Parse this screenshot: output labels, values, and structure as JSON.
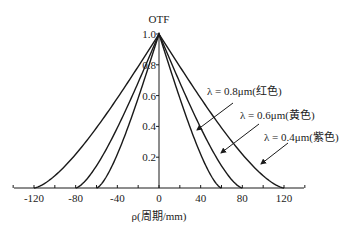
{
  "chart_data": {
    "type": "line",
    "title": "",
    "xlabel": "ρ(周期/mm)",
    "ylabel": "OTF",
    "xlim": [
      -140,
      140
    ],
    "ylim": [
      0,
      1.0
    ],
    "grid": false,
    "legend": "annotations with arrows",
    "x_ticks": [
      -120,
      -80,
      -40,
      0,
      40,
      80,
      120
    ],
    "x_tick_labels": [
      "-120",
      "-80",
      "-40",
      "0",
      "40",
      "80",
      "120"
    ],
    "y_ticks": [
      0.2,
      0.4,
      0.6,
      0.8,
      1.0
    ],
    "y_tick_labels": [
      "0.2",
      "0.4",
      "0.6",
      "0.8",
      "1.0"
    ],
    "x": [
      0,
      0.1,
      0.2,
      0.3,
      0.4,
      0.5,
      0.6,
      0.7,
      0.8,
      0.9,
      1.0
    ],
    "x_note": "normalized frequency ρ/ρc; curves are symmetric about ρ=0",
    "series": [
      {
        "name": "λ = 0.8μm(红色)",
        "cutoff": 60,
        "rho": [
          0,
          6,
          12,
          18,
          24,
          30,
          36,
          42,
          48,
          54,
          60
        ],
        "values": [
          1.0,
          0.873,
          0.747,
          0.624,
          0.505,
          0.391,
          0.285,
          0.188,
          0.104,
          0.037,
          0.0
        ]
      },
      {
        "name": "λ = 0.6μm(黄色)",
        "cutoff": 80,
        "rho": [
          0,
          8,
          16,
          24,
          32,
          40,
          48,
          56,
          64,
          72,
          80
        ],
        "values": [
          1.0,
          0.873,
          0.747,
          0.624,
          0.505,
          0.391,
          0.285,
          0.188,
          0.104,
          0.037,
          0.0
        ]
      },
      {
        "name": "λ = 0.4μm(紫色)",
        "cutoff": 120,
        "rho": [
          0,
          12,
          24,
          36,
          48,
          60,
          72,
          84,
          96,
          108,
          120
        ],
        "values": [
          1.0,
          0.873,
          0.747,
          0.624,
          0.505,
          0.391,
          0.285,
          0.188,
          0.104,
          0.037,
          0.0
        ]
      }
    ],
    "annotations": [
      {
        "text": "λ = 0.8μm(红色)",
        "target_series": 0
      },
      {
        "text": "λ = 0.6μm(黄色)",
        "target_series": 1
      },
      {
        "text": "λ = 0.4μm(紫色)",
        "target_series": 2
      }
    ]
  },
  "layout": {
    "origin_px": [
      159,
      188
    ],
    "x_scale_px_per_unit": 1.0417,
    "y_scale_px_per_unit": 154,
    "x_axis_px": [
      14,
      304
    ],
    "y_axis_top_px": 34
  },
  "labels": {
    "ylabel": "OTF",
    "xlabel": "ρ(周期/mm)",
    "ann0": "λ = 0.8μm(红色)",
    "ann1": "λ = 0.6μm(黄色)",
    "ann2": "λ = 0.4μm(紫色)"
  }
}
